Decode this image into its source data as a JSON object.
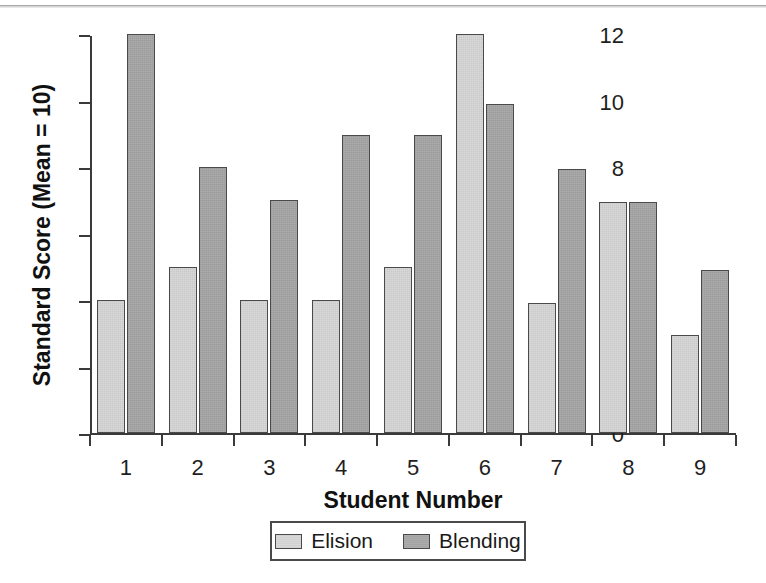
{
  "chart_data": {
    "type": "bar",
    "title": "",
    "xlabel": "Student Number",
    "ylabel": "Standard Score (Mean = 10)",
    "categories": [
      "1",
      "2",
      "3",
      "4",
      "5",
      "6",
      "7",
      "8",
      "9"
    ],
    "series": [
      {
        "name": "Elision",
        "color": "#d9d9d9",
        "values": [
          4,
          5,
          4,
          4,
          5,
          12,
          3.9,
          6.95,
          2.95
        ]
      },
      {
        "name": "Blending",
        "color": "#a3a3a3",
        "values": [
          12,
          8,
          7,
          8.95,
          8.95,
          9.9,
          7.95,
          6.95,
          4.9
        ]
      }
    ],
    "ylim": [
      0,
      12
    ],
    "yticks": [
      0,
      2,
      4,
      6,
      8,
      10,
      12
    ],
    "ytick_labels": [
      "0",
      "2",
      "4",
      "6",
      "8",
      "10",
      "12"
    ],
    "grid": false,
    "legend_position": "bottom-center",
    "legend_entries": [
      "Elision",
      "Blending"
    ],
    "axis_color": "#3a3a3a",
    "bar_edge_color": "#4a4a4a",
    "background_color": "#ffffff"
  }
}
